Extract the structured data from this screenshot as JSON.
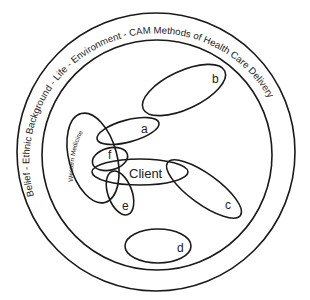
{
  "diagram": {
    "outer_ring_label": "Belief - Ethnic Background - Life - Environment - CAM Methods of Health Care Delivery",
    "western_medicine_label": "Western Medicine",
    "center_label": "Client",
    "ellipses": [
      {
        "id": "a",
        "label": "a"
      },
      {
        "id": "b",
        "label": "b"
      },
      {
        "id": "c",
        "label": "c"
      },
      {
        "id": "d",
        "label": "d"
      },
      {
        "id": "e",
        "label": "e"
      },
      {
        "id": "f",
        "label": "f"
      }
    ],
    "colors": {
      "stroke": "#1a1a1a",
      "text": "#222222",
      "background": "#ffffff"
    }
  }
}
